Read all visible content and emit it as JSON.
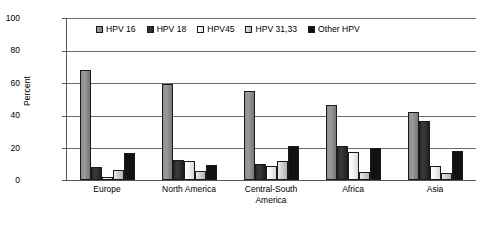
{
  "chart_data": {
    "type": "bar",
    "title": "",
    "xlabel": "",
    "ylabel": "Percent",
    "ylim": [
      0,
      100
    ],
    "yticks": [
      0,
      20,
      40,
      60,
      80,
      100
    ],
    "grid": true,
    "legend_position": "top-inside",
    "categories": [
      "Europe",
      "North America",
      "Central-South America",
      "Africa",
      "Asia"
    ],
    "category_lines": [
      [
        "Europe"
      ],
      [
        "North America"
      ],
      [
        "Central-South",
        "America"
      ],
      [
        "Africa"
      ],
      [
        "Asia"
      ]
    ],
    "series": [
      {
        "name": "HPV 16",
        "color": "#8d8d8d",
        "values": [
          68,
          59,
          55,
          46,
          42
        ]
      },
      {
        "name": "HPV 18",
        "color": "#2b2b2b",
        "values": [
          8,
          12.5,
          10,
          21,
          36.5
        ]
      },
      {
        "name": "HPV45",
        "color": "#f2f2f2",
        "values": [
          2,
          11.5,
          8.5,
          17,
          8.5
        ]
      },
      {
        "name": "HPV  31,33",
        "color": "#d3d3d3",
        "values": [
          6,
          5.5,
          12,
          5,
          4.5
        ]
      },
      {
        "name": "Other HPV",
        "color": "#111111",
        "values": [
          16.5,
          9,
          21,
          19.5,
          18
        ]
      }
    ]
  }
}
